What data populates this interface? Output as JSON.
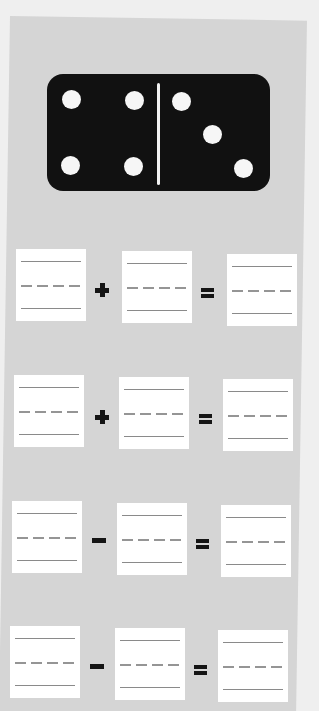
{
  "worksheet": {
    "title": "",
    "background_color": "#d5d5d5",
    "domino": {
      "left_pips": 4,
      "right_pips": 3,
      "color": "#111111",
      "pip_color": "#f6f6f6"
    },
    "equations": [
      {
        "operand_a": "",
        "operator": "+",
        "operand_b": "",
        "equals": "=",
        "result": ""
      },
      {
        "operand_a": "",
        "operator": "+",
        "operand_b": "",
        "equals": "=",
        "result": ""
      },
      {
        "operand_a": "",
        "operator": "-",
        "operand_b": "",
        "equals": "=",
        "result": ""
      },
      {
        "operand_a": "",
        "operator": "-",
        "operand_b": "",
        "equals": "=",
        "result": ""
      }
    ],
    "icons": {
      "plus": "plus-icon",
      "minus": "minus-icon",
      "equals": "equals-icon"
    }
  }
}
